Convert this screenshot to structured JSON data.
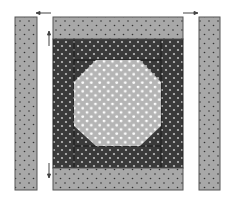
{
  "diagram": {
    "type": "quilt-block-assembly",
    "colors": {
      "light_fabric": "#a8a8a8",
      "dark_fabric": "#3a3a3a",
      "center_fabric": "#b5b5b5",
      "outline": "#555555",
      "light_dot": "#333333",
      "dark_dot": "#bdbdbd",
      "center_dot": "#ffffff",
      "arrow": "#444444"
    },
    "pieces": [
      {
        "name": "left-side-strip",
        "x": 15,
        "y": 17,
        "w": 22,
        "h": 173
      },
      {
        "name": "right-side-strip",
        "x": 199,
        "y": 17,
        "w": 21,
        "h": 173
      },
      {
        "name": "top-border-strip",
        "x": 53,
        "y": 17,
        "w": 130,
        "h": 22
      },
      {
        "name": "bottom-border-strip",
        "x": 53,
        "y": 168,
        "w": 130,
        "h": 22
      },
      {
        "name": "dark-frame",
        "x": 53,
        "y": 39,
        "w": 130,
        "h": 129
      },
      {
        "name": "octagon-center",
        "points": "96,60 140,60 161,82 161,126 140,146 96,146 74,126 74,82"
      }
    ],
    "arrows": [
      {
        "name": "arrow-left-top",
        "direction": "left"
      },
      {
        "name": "arrow-right-top",
        "direction": "right"
      },
      {
        "name": "arrow-up-left",
        "direction": "up"
      },
      {
        "name": "arrow-down-left",
        "direction": "down"
      }
    ]
  }
}
